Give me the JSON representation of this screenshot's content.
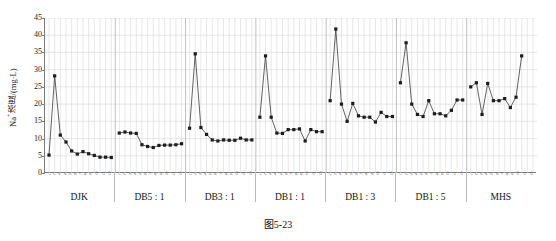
{
  "caption": "图5-23",
  "chart_data": {
    "type": "line",
    "title": "",
    "subtitle": "",
    "xlabel": "",
    "ylabel": "Na⁺浓度/(mg·L)",
    "ylabel_main": "浓度/(mg·L)",
    "ylabel_prefix": "Na",
    "ylabel_sup": "+",
    "ylim": [
      0,
      45
    ],
    "yticks": [
      0,
      5,
      10,
      15,
      20,
      25,
      30,
      35,
      40,
      45
    ],
    "ytick_labels": [
      "0",
      "5",
      "10",
      "15",
      "20",
      "25",
      "30",
      "35",
      "40",
      "45"
    ],
    "grid": true,
    "grid_color": "#d7d7d7",
    "legend": "none",
    "marker": "square",
    "marker_color": "#1c1c1c",
    "line_color": "#3a3a3a",
    "xtick_labels": [
      "1",
      "2",
      "3",
      "4",
      "5",
      "6",
      "7",
      "8",
      "9",
      "10",
      "11",
      "12"
    ],
    "group_labels": [
      "DJK",
      "DB5 : 1",
      "DB3 : 1",
      "DB1 : 1",
      "DB1 : 3",
      "DB1 : 5",
      "MHS"
    ],
    "series": [
      {
        "name": "DJK",
        "x": [
          1,
          2,
          3,
          4,
          5,
          6,
          7,
          8,
          9,
          10,
          11,
          12
        ],
        "values": [
          5.2,
          28.2,
          11.0,
          9.0,
          6.4,
          5.5,
          6.2,
          5.6,
          5.1,
          4.6,
          4.6,
          4.5
        ]
      },
      {
        "name": "DB5 : 1",
        "x": [
          1,
          2,
          3,
          4,
          5,
          6,
          7,
          8,
          9,
          10,
          11,
          12
        ],
        "values": [
          11.6,
          11.9,
          11.6,
          11.5,
          8.2,
          7.7,
          7.4,
          8.0,
          8.1,
          8.1,
          8.2,
          8.5
        ]
      },
      {
        "name": "DB3 : 1",
        "x": [
          1,
          2,
          3,
          4,
          5,
          6,
          7,
          8,
          9,
          10,
          11,
          12
        ],
        "values": [
          13.0,
          34.6,
          13.2,
          11.2,
          9.6,
          9.3,
          9.6,
          9.5,
          9.5,
          10.1,
          9.6,
          9.6
        ]
      },
      {
        "name": "DB1 : 1",
        "x": [
          1,
          2,
          3,
          4,
          5,
          6,
          7,
          8,
          9,
          10,
          11,
          12
        ],
        "values": [
          16.2,
          34.0,
          16.2,
          11.6,
          11.5,
          12.6,
          12.6,
          12.8,
          9.3,
          12.6,
          12.0,
          12.0
        ]
      },
      {
        "name": "DB1 : 3",
        "x": [
          1,
          2,
          3,
          4,
          5,
          6,
          7,
          8,
          9,
          10,
          11,
          12
        ],
        "values": [
          21.0,
          41.8,
          20.0,
          15.0,
          20.2,
          16.6,
          16.2,
          16.2,
          14.8,
          17.6,
          16.4,
          16.4
        ]
      },
      {
        "name": "DB1 : 5",
        "x": [
          1,
          2,
          3,
          4,
          5,
          6,
          7,
          8,
          9,
          10,
          11,
          12
        ],
        "values": [
          26.2,
          37.8,
          20.0,
          17.0,
          16.4,
          21.0,
          17.2,
          17.2,
          16.6,
          18.2,
          21.2,
          21.2
        ]
      },
      {
        "name": "MHS",
        "x": [
          1,
          2,
          3,
          4,
          5,
          6,
          7,
          8,
          9,
          10,
          11,
          12
        ],
        "values": [
          25.0,
          26.2,
          17.0,
          26.0,
          21.0,
          21.0,
          21.6,
          19.0,
          22.0,
          34.0,
          null,
          null
        ]
      }
    ]
  }
}
